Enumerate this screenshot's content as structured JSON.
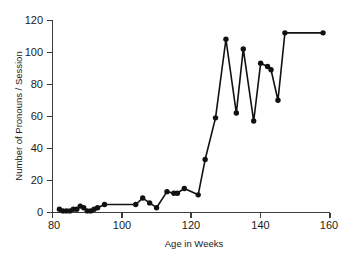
{
  "chart_data": {
    "type": "line",
    "title": "",
    "subtitle": "",
    "xlabel": "Age in Weeks",
    "ylabel": "Number of Pronouns / Session",
    "xlim": [
      80,
      160
    ],
    "ylim": [
      0,
      120
    ],
    "xticks": [
      80,
      100,
      120,
      140,
      160
    ],
    "yticks": [
      0,
      20,
      40,
      60,
      80,
      100,
      120
    ],
    "xtick_labels": [
      "80",
      "100",
      "120",
      "140",
      "160"
    ],
    "ytick_labels": [
      "0",
      "20",
      "40",
      "60",
      "80",
      "100",
      "120"
    ],
    "grid": false,
    "legend": null,
    "legend_position": "none",
    "annotations": [],
    "marker": "filled-circle",
    "line_color": "#111111",
    "marker_color": "#111111",
    "background_color": "#ffffff",
    "axis_color": "#3d3d3d",
    "series": [
      {
        "name": "Pronouns per session",
        "x": [
          82,
          83,
          84,
          85,
          86,
          87,
          88,
          89,
          90,
          91,
          92,
          93,
          95,
          104,
          106,
          108,
          110,
          113,
          115,
          116,
          118,
          122,
          124,
          127,
          130,
          133,
          135,
          138,
          140,
          142,
          143,
          145,
          147,
          158
        ],
        "values": [
          2,
          1,
          1,
          1,
          2,
          2,
          4,
          3,
          1,
          1,
          2,
          3,
          5,
          5,
          9,
          6,
          3,
          13,
          12,
          12,
          15,
          11,
          33,
          59,
          108,
          62,
          102,
          57,
          93,
          91,
          89,
          70,
          112,
          112
        ]
      }
    ]
  },
  "axes": {
    "x_axis_name": "age-in-weeks-axis",
    "y_axis_name": "pronouns-per-session-axis"
  }
}
